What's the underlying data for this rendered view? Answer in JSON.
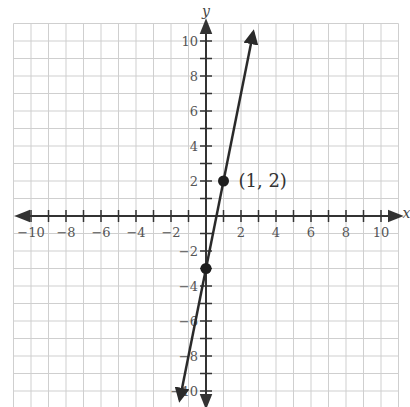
{
  "chart_data": {
    "type": "line",
    "title": "",
    "xlabel": "x",
    "ylabel": "y",
    "xlim": [
      -11,
      11
    ],
    "ylim": [
      -11,
      11
    ],
    "grid": true,
    "x_ticks": [
      -10,
      -8,
      -6,
      -4,
      -2,
      2,
      4,
      6,
      8,
      10
    ],
    "y_ticks": [
      -10,
      -8,
      -6,
      -4,
      -2,
      2,
      4,
      6,
      8,
      10
    ],
    "tick_labels_x": [
      "−10",
      "−8",
      "−6",
      "−4",
      "−2",
      "2",
      "4",
      "6",
      "8",
      "10"
    ],
    "tick_labels_y": [
      "−10",
      "−8",
      "−6",
      "−4",
      "−2",
      "2",
      "4",
      "6",
      "8",
      "10"
    ],
    "series": [
      {
        "name": "line",
        "equation": "y = 5x - 3",
        "slope": 5,
        "intercept": -3,
        "x_range": [
          -1.5,
          2.7
        ],
        "arrows": "both"
      }
    ],
    "points": [
      {
        "x": 0,
        "y": -3,
        "label": ""
      },
      {
        "x": 1,
        "y": 2,
        "label": "(1, 2)"
      }
    ],
    "annotations": [
      {
        "text": "(1, 2)",
        "x": 1,
        "y": 2
      }
    ]
  },
  "colors": {
    "grid": "#cfcfcf",
    "axis": "#333333",
    "line": "#2a2a2a",
    "point": "#1e1e1e",
    "label": "#555555"
  },
  "layout": {
    "origin_px": [
      206,
      216
    ],
    "cell_px": 17.5
  }
}
